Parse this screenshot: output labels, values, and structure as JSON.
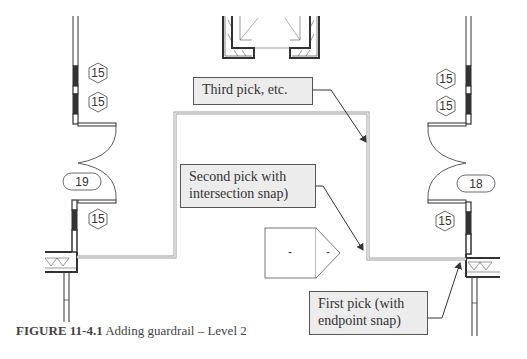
{
  "figure": {
    "label": "FIGURE",
    "number": "11-4.1",
    "title": "Adding guardrail – Level 2"
  },
  "callouts": [
    {
      "id": "third-pick",
      "text": "Third pick, etc."
    },
    {
      "id": "second-pick",
      "line1": "Second pick with",
      "line2": "intersection snap)"
    },
    {
      "id": "first-pick",
      "line1": "First pick (with",
      "line2": "endpoint snap)"
    }
  ],
  "tags": {
    "hex": [
      "15",
      "15",
      "15",
      "15",
      "15",
      "15"
    ],
    "oval": [
      "19",
      "18"
    ]
  },
  "section_marker": {
    "left": "-",
    "right": "-"
  },
  "colors": {
    "line": "#333333",
    "rail": "#999999",
    "callout_bg": "#ececec",
    "callout_border": "#555555"
  }
}
